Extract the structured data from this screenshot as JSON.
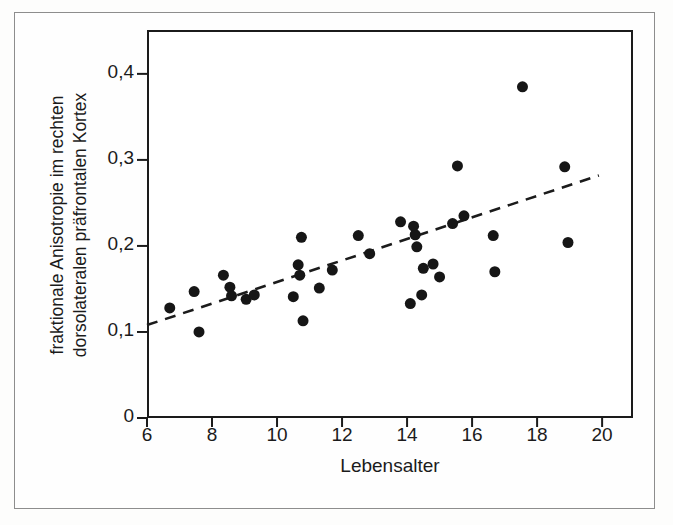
{
  "figure": {
    "background_color": "#fefefe",
    "border_color": "#8d8d8d",
    "ink_color": "#1b1b1b"
  },
  "chart_data": {
    "type": "scatter",
    "title": "",
    "subtitle": "",
    "xlabel": "Lebensalter",
    "ylabel": "fraktionale Anisotropie im rechten dorsolateralen präfrontalen Kortex",
    "ylabel_lines": [
      "fraktionale Anisotropie im rechten",
      "dorsolateralen präfrontalen Kortex"
    ],
    "xlim": [
      6,
      20.95
    ],
    "ylim": [
      0,
      0.451
    ],
    "xticks": [
      6,
      8,
      10,
      12,
      14,
      16,
      18,
      20
    ],
    "xtick_labels": [
      "6",
      "8",
      "10",
      "12",
      "14",
      "16",
      "18",
      "20"
    ],
    "yticks": [
      0,
      0.1,
      0.2,
      0.3,
      0.4
    ],
    "ytick_labels": [
      "0",
      "0,1",
      "0,2",
      "0,3",
      "0,4"
    ],
    "grid": false,
    "legend": null,
    "marker": {
      "shape": "circle",
      "color": "#161616",
      "size_px": 11
    },
    "points": [
      {
        "x": 6.7,
        "y": 0.128
      },
      {
        "x": 7.45,
        "y": 0.147
      },
      {
        "x": 7.6,
        "y": 0.1
      },
      {
        "x": 8.35,
        "y": 0.166
      },
      {
        "x": 8.55,
        "y": 0.152
      },
      {
        "x": 8.6,
        "y": 0.142
      },
      {
        "x": 9.05,
        "y": 0.138
      },
      {
        "x": 9.3,
        "y": 0.143
      },
      {
        "x": 10.5,
        "y": 0.141
      },
      {
        "x": 10.65,
        "y": 0.178
      },
      {
        "x": 10.7,
        "y": 0.166
      },
      {
        "x": 10.75,
        "y": 0.21
      },
      {
        "x": 10.8,
        "y": 0.113
      },
      {
        "x": 11.3,
        "y": 0.151
      },
      {
        "x": 11.7,
        "y": 0.172
      },
      {
        "x": 12.5,
        "y": 0.212
      },
      {
        "x": 12.85,
        "y": 0.191
      },
      {
        "x": 13.8,
        "y": 0.228
      },
      {
        "x": 14.1,
        "y": 0.133
      },
      {
        "x": 14.2,
        "y": 0.223
      },
      {
        "x": 14.25,
        "y": 0.213
      },
      {
        "x": 14.3,
        "y": 0.199
      },
      {
        "x": 14.45,
        "y": 0.143
      },
      {
        "x": 14.5,
        "y": 0.174
      },
      {
        "x": 14.8,
        "y": 0.179
      },
      {
        "x": 15.0,
        "y": 0.164
      },
      {
        "x": 15.4,
        "y": 0.226
      },
      {
        "x": 15.55,
        "y": 0.293
      },
      {
        "x": 15.75,
        "y": 0.235
      },
      {
        "x": 16.65,
        "y": 0.212
      },
      {
        "x": 16.7,
        "y": 0.17
      },
      {
        "x": 17.55,
        "y": 0.385
      },
      {
        "x": 18.85,
        "y": 0.292
      },
      {
        "x": 18.95,
        "y": 0.204
      }
    ],
    "trend_line": {
      "style": "dashed",
      "color": "#1b1b1b",
      "x_start": 6.0,
      "y_start": 0.108,
      "x_end": 19.9,
      "y_end": 0.282
    }
  }
}
